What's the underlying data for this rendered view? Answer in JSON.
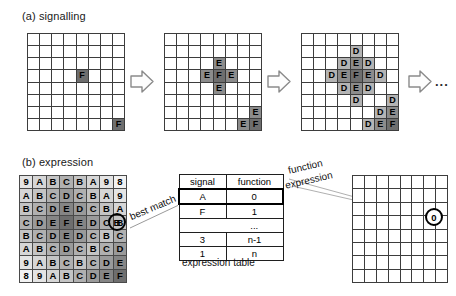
{
  "figure": {
    "panel_a_title": "(a) signalling",
    "panel_b_title": "(b) expression",
    "ellipsis": "...",
    "grid_rows": 8,
    "grid_cols": 8,
    "colors": {
      "grid_line": "#3d3d3d",
      "shade_D": "#b4b4b4",
      "shade_E": "#8c8c8c",
      "shade_F": "#6e6e6e",
      "background": "#ffffff"
    }
  },
  "panel_a": {
    "grids": [
      {
        "name": "step-1",
        "cells": [
          {
            "r": 3,
            "c": 4,
            "label": "F",
            "shade": "F"
          },
          {
            "r": 7,
            "c": 7,
            "label": "F",
            "shade": "F"
          }
        ]
      },
      {
        "name": "step-2",
        "cells": [
          {
            "r": 2,
            "c": 4,
            "label": "E",
            "shade": "E"
          },
          {
            "r": 3,
            "c": 3,
            "label": "E",
            "shade": "E"
          },
          {
            "r": 3,
            "c": 4,
            "label": "F",
            "shade": "F"
          },
          {
            "r": 3,
            "c": 5,
            "label": "E",
            "shade": "E"
          },
          {
            "r": 4,
            "c": 4,
            "label": "E",
            "shade": "E"
          },
          {
            "r": 6,
            "c": 7,
            "label": "E",
            "shade": "E"
          },
          {
            "r": 7,
            "c": 6,
            "label": "E",
            "shade": "E"
          },
          {
            "r": 7,
            "c": 7,
            "label": "F",
            "shade": "F"
          }
        ]
      },
      {
        "name": "step-3",
        "cells": [
          {
            "r": 1,
            "c": 4,
            "label": "D",
            "shade": "D"
          },
          {
            "r": 2,
            "c": 3,
            "label": "D",
            "shade": "D"
          },
          {
            "r": 2,
            "c": 4,
            "label": "E",
            "shade": "E"
          },
          {
            "r": 2,
            "c": 5,
            "label": "D",
            "shade": "D"
          },
          {
            "r": 3,
            "c": 2,
            "label": "D",
            "shade": "D"
          },
          {
            "r": 3,
            "c": 3,
            "label": "E",
            "shade": "E"
          },
          {
            "r": 3,
            "c": 4,
            "label": "F",
            "shade": "F"
          },
          {
            "r": 3,
            "c": 5,
            "label": "E",
            "shade": "E"
          },
          {
            "r": 3,
            "c": 6,
            "label": "D",
            "shade": "D"
          },
          {
            "r": 4,
            "c": 3,
            "label": "D",
            "shade": "D"
          },
          {
            "r": 4,
            "c": 4,
            "label": "E",
            "shade": "E"
          },
          {
            "r": 4,
            "c": 5,
            "label": "D",
            "shade": "D"
          },
          {
            "r": 5,
            "c": 4,
            "label": "D",
            "shade": "D"
          },
          {
            "r": 5,
            "c": 7,
            "label": "D",
            "shade": "D"
          },
          {
            "r": 6,
            "c": 6,
            "label": "D",
            "shade": "D"
          },
          {
            "r": 6,
            "c": 7,
            "label": "E",
            "shade": "E"
          },
          {
            "r": 7,
            "c": 5,
            "label": "D",
            "shade": "D"
          },
          {
            "r": 7,
            "c": 6,
            "label": "E",
            "shade": "E"
          },
          {
            "r": 7,
            "c": 7,
            "label": "F",
            "shade": "F"
          }
        ]
      }
    ]
  },
  "panel_b": {
    "expression_grid": {
      "rows": [
        [
          "9",
          "A",
          "B",
          "C",
          "B",
          "A",
          "9",
          "8"
        ],
        [
          "A",
          "B",
          "C",
          "D",
          "C",
          "B",
          "A",
          "9"
        ],
        [
          "B",
          "C",
          "D",
          "E",
          "D",
          "C",
          "B",
          "A"
        ],
        [
          "C",
          "D",
          "E",
          "F",
          "E",
          "D",
          "C",
          "B"
        ],
        [
          "B",
          "C",
          "D",
          "E",
          "D",
          "C",
          "B",
          "C"
        ],
        [
          "A",
          "B",
          "C",
          "D",
          "C",
          "B",
          "C",
          "D"
        ],
        [
          "9",
          "A",
          "B",
          "C",
          "B",
          "C",
          "D",
          "E"
        ],
        [
          "8",
          "9",
          "A",
          "B",
          "C",
          "D",
          "E",
          "F"
        ]
      ],
      "highlight": {
        "r": 3,
        "c": 7,
        "label": "B"
      }
    },
    "best_match_label": "best match",
    "function_expression_label_line1": "function",
    "function_expression_label_line2": "expression",
    "table": {
      "headers": [
        "signal",
        "function"
      ],
      "rows": [
        {
          "signal": "A",
          "function": "0",
          "highlight": true
        },
        {
          "signal": "F",
          "function": "1",
          "highlight": false
        },
        {
          "signal": "",
          "function": "...",
          "highlight": false,
          "dots": true
        },
        {
          "signal": "3",
          "function": "n-1",
          "highlight": false
        },
        {
          "signal": "1",
          "function": "n",
          "highlight": false
        }
      ],
      "caption": "expression table"
    },
    "output_grid": {
      "marker": "0",
      "marker_cell": {
        "r": 3,
        "c": 7
      }
    }
  }
}
